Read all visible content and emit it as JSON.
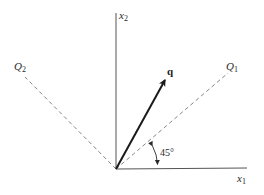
{
  "diagram": {
    "type": "coordinate-rotation",
    "origin": {
      "x": 116,
      "y": 169
    },
    "axes": {
      "x1": {
        "label": "x",
        "subscript": "1"
      },
      "x2": {
        "label": "x",
        "subscript": "2"
      }
    },
    "rotated_axes": {
      "Q1": {
        "label": "Q",
        "subscript": "1",
        "style": "dashed"
      },
      "Q2": {
        "label": "Q",
        "subscript": "2",
        "style": "dashed"
      }
    },
    "vector": {
      "label": "q",
      "style": "bold-arrow"
    },
    "angle": {
      "label": "45°",
      "between": [
        "x1",
        "Q1"
      ]
    },
    "colors": {
      "axis": "#555555",
      "dashed": "#777777",
      "vector": "#1a1a1a",
      "text": "#2a2a2a"
    }
  }
}
